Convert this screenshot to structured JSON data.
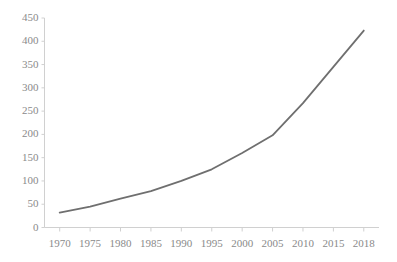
{
  "chart_data": {
    "type": "line",
    "title": "",
    "subtitle": "",
    "xlabel": "",
    "ylabel": "",
    "x": [
      1970,
      1975,
      1980,
      1985,
      1990,
      1995,
      2000,
      2005,
      2010,
      2015,
      2018
    ],
    "categories": [
      "1970",
      "1975",
      "1980",
      "1985",
      "1990",
      "1995",
      "2000",
      "2005",
      "2010",
      "2015",
      "2018"
    ],
    "values": [
      32,
      45,
      62,
      78,
      100,
      125,
      160,
      198,
      267,
      345,
      423
    ],
    "series": [
      {
        "name": "",
        "values": [
          32,
          45,
          62,
          78,
          100,
          125,
          160,
          198,
          267,
          345,
          423
        ]
      }
    ],
    "xlim": [
      1970,
      2018
    ],
    "ylim": [
      0,
      450
    ],
    "ytick_labels": [
      "0",
      "50",
      "100",
      "150",
      "200",
      "250",
      "300",
      "350",
      "400",
      "450"
    ],
    "ytick_values": [
      0,
      50,
      100,
      150,
      200,
      250,
      300,
      350,
      400,
      450
    ],
    "xtick_labels": [
      "1970",
      "1975",
      "1980",
      "1985",
      "1990",
      "1995",
      "2000",
      "2005",
      "2010",
      "2015",
      "2018"
    ],
    "grid": false,
    "legend": "none",
    "line_color": "#6f6f6f",
    "axis_color": "#d0d0d0",
    "tick_label_color": "#8a8a8a",
    "background_color": "#ffffff"
  }
}
